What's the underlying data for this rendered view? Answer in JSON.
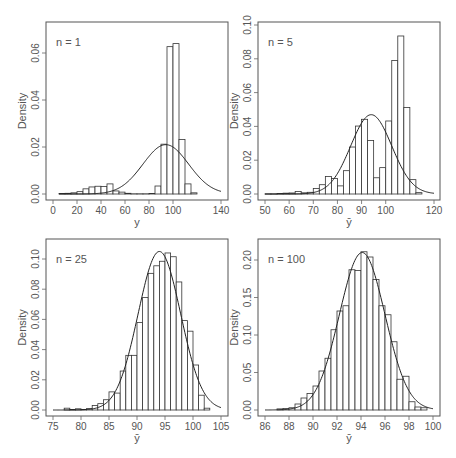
{
  "chart_data": [
    {
      "type": "bar",
      "panel": "top-left",
      "annotation": "n = 1",
      "title": "",
      "xlabel": "y",
      "ylabel": "Density",
      "xlim": [
        0,
        140
      ],
      "ylim": [
        0,
        0.07
      ],
      "x_ticks": [
        0,
        20,
        40,
        60,
        80,
        100,
        140
      ],
      "x_tick_labels": [
        "0",
        "20",
        "40",
        "60",
        "80",
        "100",
        "140"
      ],
      "y_ticks": [
        0,
        0.02,
        0.04,
        0.06
      ],
      "y_tick_labels": [
        "0.00",
        "0.02",
        "0.04",
        "0.06"
      ],
      "bin_width": 5,
      "bins_start": [
        5,
        10,
        15,
        20,
        25,
        30,
        35,
        40,
        45,
        50,
        55,
        60,
        65,
        70,
        75,
        80,
        85,
        90,
        95,
        100,
        105,
        110,
        115
      ],
      "values": [
        0.0002,
        0.0003,
        0.0005,
        0.001,
        0.0022,
        0.003,
        0.0033,
        0.0032,
        0.0043,
        0.0013,
        0.0008,
        0.0003,
        0.0001,
        0.0001,
        0.0001,
        0.0002,
        0.0034,
        0.0212,
        0.0627,
        0.064,
        0.0232,
        0.0043,
        0.0005
      ],
      "normal_curve": {
        "mean": 94,
        "sd": 19,
        "from": 5,
        "to": 140
      },
      "grid": false,
      "legend": "none"
    },
    {
      "type": "bar",
      "panel": "top-right",
      "annotation": "n = 5",
      "title": "",
      "xlabel": "ȳ",
      "ylabel": "Density",
      "xlim": [
        50,
        120
      ],
      "ylim": [
        0,
        0.1
      ],
      "x_ticks": [
        50,
        60,
        70,
        80,
        90,
        100,
        120
      ],
      "x_tick_labels": [
        "50",
        "60",
        "70",
        "80",
        "90",
        "100",
        "120"
      ],
      "y_ticks": [
        0,
        0.02,
        0.04,
        0.06,
        0.08,
        0.1
      ],
      "y_tick_labels": [
        "0.00",
        "0.02",
        "0.04",
        "0.06",
        "0.08",
        "0.10"
      ],
      "bin_width": 2.5,
      "bins_start": [
        50,
        52.5,
        55,
        57.5,
        60,
        62.5,
        65,
        67.5,
        70,
        72.5,
        75,
        77.5,
        80,
        82.5,
        85,
        87.5,
        90,
        92.5,
        95,
        97.5,
        100,
        102.5,
        105
      ],
      "values": [
        0.0001,
        0.0001,
        0.0003,
        0.0005,
        0.0006,
        0.0015,
        0.0007,
        0.001,
        0.0033,
        0.0055,
        0.0104,
        0.0092,
        0.0048,
        0.0138,
        0.0278,
        0.0402,
        0.0442,
        0.0317,
        0.0096,
        0.0156,
        0.0432,
        0.079,
        0.0935,
        0.0512,
        0.0085,
        0.0008
      ],
      "normal_curve": {
        "mean": 94,
        "sd": 8.5,
        "from": 50,
        "to": 120
      },
      "grid": false,
      "legend": "none"
    },
    {
      "type": "bar",
      "panel": "bottom-left",
      "annotation": "n = 25",
      "title": "",
      "xlabel": "ȳ",
      "ylabel": "Density",
      "xlim": [
        75,
        105
      ],
      "ylim": [
        0,
        0.11
      ],
      "x_ticks": [
        75,
        80,
        85,
        90,
        95,
        100,
        105
      ],
      "x_tick_labels": [
        "75",
        "80",
        "85",
        "90",
        "95",
        "100",
        "105"
      ],
      "y_ticks": [
        0,
        0.02,
        0.04,
        0.06,
        0.08,
        0.1
      ],
      "y_tick_labels": [
        "0.00",
        "0.02",
        "0.04",
        "0.06",
        "0.08",
        "0.10"
      ],
      "bin_width": 1,
      "bins_start": [
        77,
        78,
        79,
        80,
        81,
        82,
        83,
        84,
        85,
        86,
        87,
        88,
        89,
        90,
        91,
        92,
        93,
        94,
        95,
        96,
        97,
        98,
        99,
        100,
        101,
        102
      ],
      "values": [
        0.0012,
        0.0004,
        0.0008,
        0.0004,
        0.001,
        0.003,
        0.0042,
        0.0068,
        0.012,
        0.0112,
        0.0258,
        0.0362,
        0.0362,
        0.058,
        0.0745,
        0.0905,
        0.0955,
        0.0985,
        0.104,
        0.1015,
        0.0848,
        0.0592,
        0.0522,
        0.0298,
        0.0098,
        0.0012
      ],
      "normal_curve": {
        "mean": 94,
        "sd": 3.8,
        "from": 75,
        "to": 105
      },
      "grid": false,
      "legend": "none"
    },
    {
      "type": "bar",
      "panel": "bottom-right",
      "annotation": "n = 100",
      "title": "",
      "xlabel": "ȳ",
      "ylabel": "Density",
      "xlim": [
        86,
        100
      ],
      "ylim": [
        0,
        0.22
      ],
      "x_ticks": [
        86,
        88,
        90,
        92,
        94,
        96,
        98,
        100
      ],
      "x_tick_labels": [
        "86",
        "88",
        "90",
        "92",
        "94",
        "96",
        "98",
        "100"
      ],
      "y_ticks": [
        0,
        0.05,
        0.1,
        0.15,
        0.2
      ],
      "y_tick_labels": [
        "0.00",
        "0.05",
        "0.10",
        "0.15",
        "0.20"
      ],
      "bin_width": 0.5,
      "bins_start": [
        87,
        87.5,
        88,
        88.5,
        89,
        89.5,
        90,
        90.5,
        91,
        91.5,
        92,
        92.5,
        93,
        93.5,
        94,
        94.5,
        95,
        95.5,
        96,
        96.5,
        97,
        97.5,
        98,
        98.5,
        99
      ],
      "values": [
        0.0015,
        0.002,
        0.003,
        0.008,
        0.016,
        0.022,
        0.032,
        0.052,
        0.069,
        0.107,
        0.132,
        0.139,
        0.187,
        0.186,
        0.211,
        0.204,
        0.174,
        0.139,
        0.127,
        0.091,
        0.041,
        0.045,
        0.011,
        0.004,
        0.003
      ],
      "normal_curve": {
        "mean": 94.1,
        "sd": 1.9,
        "from": 86,
        "to": 100
      },
      "grid": false,
      "legend": "none"
    }
  ],
  "panels_layout": [
    {
      "frame": [
        46,
        22,
        228,
        200
      ],
      "plot_x": [
        53,
        221
      ],
      "plot_y0": 194,
      "plot_ytop_px": 29
    },
    {
      "frame": [
        258,
        22,
        440,
        200
      ],
      "plot_x": [
        265,
        434
      ],
      "plot_y0": 194,
      "plot_ytop_px": 25
    },
    {
      "frame": [
        46,
        239,
        228,
        416
      ],
      "plot_x": [
        53,
        221
      ],
      "plot_y0": 410,
      "plot_ytop_px": 244
    },
    {
      "frame": [
        258,
        239,
        440,
        416
      ],
      "plot_x": [
        265,
        433
      ],
      "plot_y0": 410,
      "plot_ytop_px": 260
    }
  ]
}
